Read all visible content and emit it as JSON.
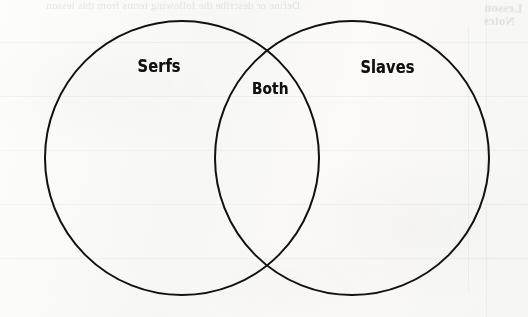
{
  "document": {
    "type": "venn-diagram-worksheet",
    "background_color": "#fbfbfa",
    "ink_color": "#111111"
  },
  "diagram": {
    "kind": "venn",
    "circle_count": 2,
    "stroke_color": "#111111",
    "stroke_width": 2,
    "left_circle": {
      "cx": 182,
      "cy": 158,
      "r": 137
    },
    "right_circle": {
      "cx": 352,
      "cy": 158,
      "r": 137
    },
    "labels": {
      "left": "Serfs",
      "overlap": "Both",
      "right": "Slaves"
    }
  },
  "show_through": {
    "heading": "Define or describe the following terms from this lesson",
    "corner_line_1": "Lesson",
    "corner_line_2": "Notes"
  }
}
